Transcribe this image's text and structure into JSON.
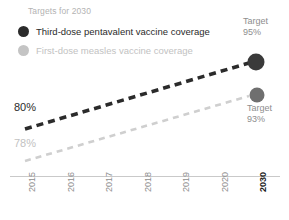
{
  "legend": {
    "title": "Targets for 2030",
    "items": [
      {
        "label": "Third-dose pentavalent vaccine coverage",
        "marker": "filled-circle-dark",
        "color": "#2b2b2b"
      },
      {
        "label": "First-dose measles vaccine coverage",
        "marker": "filled-circle-light",
        "color": "#c4c4c4"
      }
    ]
  },
  "annotations": {
    "start_pentavalent": "80%",
    "start_measles": "78%",
    "target_pentavalent_word": "Target",
    "target_pentavalent_value": "95%",
    "target_measles_word": "Target",
    "target_measles_value": "93%"
  },
  "xaxis": {
    "ticks": [
      {
        "label": "2015",
        "bold": false
      },
      {
        "label": "2016",
        "bold": false
      },
      {
        "label": "2017",
        "bold": false
      },
      {
        "label": "2018",
        "bold": false
      },
      {
        "label": "2019",
        "bold": false
      },
      {
        "label": "2020",
        "bold": false
      },
      {
        "label": "2030",
        "bold": true
      }
    ]
  },
  "chart_data": {
    "type": "line",
    "title": "Targets for 2030",
    "xlabel": "",
    "ylabel": "",
    "grid": false,
    "legend_position": "top-left",
    "x": [
      "2015",
      "2016",
      "2017",
      "2018",
      "2019",
      "2020",
      "2030"
    ],
    "xlim": [
      "2015",
      "2030"
    ],
    "ylim": [
      70,
      100
    ],
    "series": [
      {
        "name": "Third-dose pentavalent vaccine coverage",
        "color": "#2b2b2b",
        "style": "dashed",
        "start_label": "80%",
        "end_label": "95%",
        "end_label_prefix": "Target",
        "values": [
          80,
          82.5,
          85,
          87.5,
          90,
          92.5,
          95
        ],
        "endpoint_marker": true
      },
      {
        "name": "First-dose measles vaccine coverage",
        "color": "#cfcfcf",
        "marker_color": "#6f6f6f",
        "style": "dashed",
        "start_label": "78%",
        "end_label": "93%",
        "end_label_prefix": "Target",
        "values": [
          78,
          80.5,
          83,
          85.5,
          88,
          90.5,
          93
        ],
        "endpoint_marker": true
      }
    ]
  },
  "colors": {
    "dark": "#2b2b2b",
    "light_line": "#cfcfcf",
    "light_text": "#c2c2c2",
    "muted_text": "#8e8e8e",
    "axis": "#c9c9c9",
    "measles_marker": "#6f6f6f"
  }
}
